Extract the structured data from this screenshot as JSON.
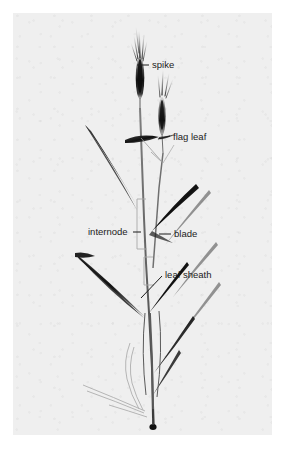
{
  "figure": {
    "kind": "botanical-photograph-with-callout-labels",
    "photo_background_color": "#efefef",
    "page_background_color": "#ffffff",
    "label_text_color": "#1b1b1b",
    "plant_color": "#1a1a1a"
  },
  "labels": [
    {
      "id": "spike",
      "text": "spike",
      "text_x": 139,
      "text_y": 55,
      "leader": "M 124 52 L 136 52",
      "anchor": "start"
    },
    {
      "id": "flag-leaf",
      "text": "flag leaf",
      "text_x": 160,
      "text_y": 127,
      "leader": "M 145 126 L 157 123",
      "anchor": "start"
    },
    {
      "id": "internode",
      "text": "internode",
      "text_x": 75,
      "text_y": 222,
      "leader": "M 120 219 L 128 219",
      "anchor": "start"
    },
    {
      "id": "blade",
      "text": "blade",
      "text_x": 161,
      "text_y": 224,
      "leader": "M 146 221 L 158 221",
      "anchor": "start"
    },
    {
      "id": "leaf-sheath",
      "text": "leaf sheath",
      "text_x": 152,
      "text_y": 265,
      "leader": "M 128 285 L 149 263",
      "anchor": "start"
    }
  ],
  "callout_count": 5
}
